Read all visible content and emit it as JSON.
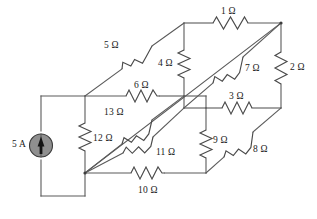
{
  "diagram": {
    "type": "electrical-circuit-schematic",
    "units": {
      "resistance": "Ω",
      "current": "A"
    },
    "colors": {
      "background": "#ffffff",
      "wire": "#5a5a5a",
      "wire_dark": "#3d3d3d",
      "resistor": "#4a4a4a",
      "label_text": "#1a1a1a",
      "source_fill": "#8f8f8f",
      "source_stroke": "#3a3a3a",
      "source_arrow": "#141414"
    },
    "source": {
      "name": "current-source",
      "label": "5 A",
      "value": 5,
      "unit": "A",
      "direction": "up",
      "symbol": "circle-with-arrow"
    },
    "resistors": [
      {
        "id": "r1",
        "label": "1 Ω",
        "value": 1,
        "unit": "Ω",
        "orientation": "horizontal",
        "edge": "top-back"
      },
      {
        "id": "r2",
        "label": "2 Ω",
        "value": 2,
        "unit": "Ω",
        "orientation": "vertical",
        "edge": "right-back"
      },
      {
        "id": "r3",
        "label": "3 Ω",
        "value": 3,
        "unit": "Ω",
        "orientation": "horizontal",
        "edge": "middle-right"
      },
      {
        "id": "r4",
        "label": "4 Ω",
        "value": 4,
        "unit": "Ω",
        "orientation": "vertical",
        "edge": "inner-top"
      },
      {
        "id": "r5",
        "label": "5 Ω",
        "value": 5,
        "unit": "Ω",
        "orientation": "diagonal",
        "edge": "top-left-depth"
      },
      {
        "id": "r6",
        "label": "6 Ω",
        "value": 6,
        "unit": "Ω",
        "orientation": "horizontal",
        "edge": "front-top"
      },
      {
        "id": "r7",
        "label": "7 Ω",
        "value": 7,
        "unit": "Ω",
        "orientation": "diagonal",
        "edge": "depth-upper-right"
      },
      {
        "id": "r8",
        "label": "8 Ω",
        "value": 8,
        "unit": "Ω",
        "orientation": "diagonal",
        "edge": "depth-lower-right"
      },
      {
        "id": "r9",
        "label": "9 Ω",
        "value": 9,
        "unit": "Ω",
        "orientation": "vertical",
        "edge": "inner-bottom"
      },
      {
        "id": "r10",
        "label": "10 Ω",
        "value": 10,
        "unit": "Ω",
        "orientation": "horizontal",
        "edge": "bottom-front"
      },
      {
        "id": "r11",
        "label": "11 Ω",
        "value": 11,
        "unit": "Ω",
        "orientation": "diagonal",
        "edge": "body-diagonal-lower"
      },
      {
        "id": "r12",
        "label": "12 Ω",
        "value": 12,
        "unit": "Ω",
        "orientation": "vertical",
        "edge": "front-left"
      },
      {
        "id": "r13",
        "label": "13 Ω",
        "value": 13,
        "unit": "Ω",
        "orientation": "diagonal",
        "edge": "body-diagonal-upper"
      }
    ],
    "labels": {
      "source": "5 A",
      "r1": "1 Ω",
      "r2": "2 Ω",
      "r3": "3 Ω",
      "r4": "4 Ω",
      "r5": "5 Ω",
      "r6": "6 Ω",
      "r7": "7 Ω",
      "r8": "8 Ω",
      "r9": "9 Ω",
      "r10": "10 Ω",
      "r11": "11 Ω",
      "r12": "12 Ω",
      "r13": "13 Ω"
    }
  }
}
